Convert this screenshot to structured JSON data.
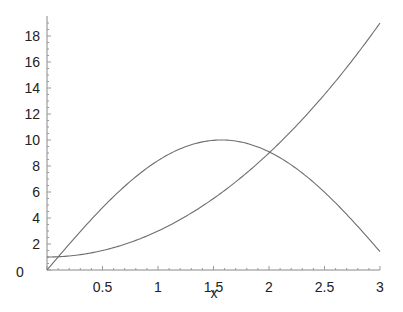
{
  "chart_data": {
    "type": "line",
    "title": "",
    "xlabel": "x",
    "ylabel": "",
    "xlim": [
      0,
      3
    ],
    "ylim": [
      0,
      19
    ],
    "x_ticks": [
      0.5,
      1,
      1.5,
      2,
      2.5,
      3
    ],
    "x_tick_labels": [
      "0.5",
      "1",
      "1.5",
      "2",
      "2.5",
      "3"
    ],
    "y_ticks": [
      0,
      2,
      4,
      6,
      8,
      10,
      12,
      14,
      16,
      18
    ],
    "y_tick_labels": [
      "0",
      "2",
      "4",
      "6",
      "8",
      "10",
      "12",
      "14",
      "16",
      "18"
    ],
    "grid": false,
    "legend": null,
    "series": [
      {
        "name": "2*x^2+1",
        "x": [
          0,
          0.25,
          0.5,
          0.75,
          1,
          1.25,
          1.5,
          1.75,
          2,
          2.25,
          2.5,
          2.75,
          3
        ],
        "values": [
          1,
          1.125,
          1.5,
          2.125,
          3,
          4.125,
          5.5,
          7.125,
          9,
          11.125,
          13.5,
          16.125,
          19
        ],
        "color": "#6e6e6e"
      },
      {
        "name": "10*sin(x)",
        "x": [
          0,
          0.25,
          0.5,
          0.75,
          1,
          1.25,
          1.5,
          1.57,
          1.75,
          2,
          2.25,
          2.5,
          2.75,
          3
        ],
        "values": [
          0,
          2.47,
          4.79,
          6.82,
          8.41,
          9.49,
          9.97,
          10,
          9.84,
          9.09,
          7.78,
          5.98,
          3.82,
          1.41
        ],
        "color": "#6e6e6e"
      }
    ]
  }
}
